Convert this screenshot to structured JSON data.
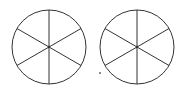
{
  "diagram": {
    "stroke_color": "#333333",
    "background": "#ffffff",
    "circles": [
      {
        "id": "left",
        "cx": 49,
        "cy": 47,
        "r": 37,
        "sectors": 6
      },
      {
        "id": "right",
        "cx": 137,
        "cy": 47,
        "r": 37,
        "sectors": 6
      }
    ],
    "dot": {
      "cx": 100,
      "cy": 73,
      "r": 1
    }
  }
}
